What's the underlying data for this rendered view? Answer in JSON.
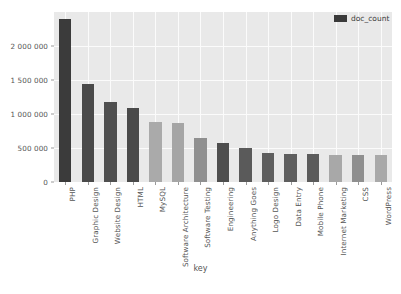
{
  "chart_data": {
    "type": "bar",
    "title": "",
    "xlabel": "key",
    "ylabel": "",
    "ylim": [
      0,
      2500000
    ],
    "grid": true,
    "legend_position": "top-right",
    "legend": [
      "doc_count"
    ],
    "ytick_labels": [
      "0",
      "500 000",
      "1 000 000",
      "1 500 000",
      "2 000 000"
    ],
    "ytick_values": [
      0,
      500000,
      1000000,
      1500000,
      2000000
    ],
    "categories": [
      "PHP",
      "Graphic Design",
      "Website Design",
      "HTML",
      "MySQL",
      "Software Architecture",
      "Software Testing",
      "Engineering",
      "Anything Goes",
      "Logo Design",
      "Data Entry",
      "Mobile Phone",
      "Internet Marketing",
      "CSS",
      "WordPress"
    ],
    "series": [
      {
        "name": "doc_count",
        "values": [
          2400000,
          1440000,
          1175000,
          1090000,
          880000,
          870000,
          650000,
          580000,
          500000,
          420000,
          415000,
          415000,
          400000,
          395000,
          390000
        ]
      }
    ],
    "bar_colors": [
      "#3b3b3b",
      "#4a4a4a",
      "#4f4f4f",
      "#4a4a4a",
      "#aaaaaa",
      "#a5a5a5",
      "#8f8f8f",
      "#4e4e4e",
      "#5a5a5a",
      "#5e5e5e",
      "#5e5e5e",
      "#5b5b5b",
      "#a8a8a8",
      "#8f8f8f",
      "#a9a9a9"
    ],
    "plot_background": "#e9e9e9",
    "grid_color": "#fbfbfb",
    "axis_text_color": "#555555"
  }
}
